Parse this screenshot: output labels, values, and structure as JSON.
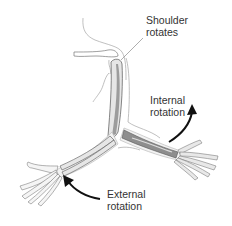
{
  "diagram": {
    "labels": {
      "shoulder": {
        "line1": "Shoulder",
        "line2": "rotates"
      },
      "internal": {
        "line1": "Internal",
        "line2": "rotation"
      },
      "external": {
        "line1": "External",
        "line2": "rotation"
      }
    },
    "colors": {
      "outline": "#a8a8a8",
      "bone_fill": "#e6e6e6",
      "bone_shadow": "#9c9c9c",
      "bone_stroke": "#555555",
      "rotated_forearm_fill": "#8e8e8e",
      "arrow": "#111111",
      "text": "#333333"
    }
  }
}
